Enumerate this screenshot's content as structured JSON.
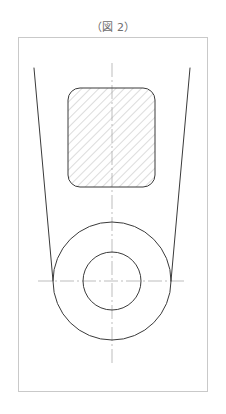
{
  "figure": {
    "title": "（図 2）",
    "caption_color": "#6e6e6e"
  },
  "canvas": {
    "width": 226,
    "height": 414,
    "background": "#ffffff"
  },
  "colors": {
    "frame_stroke": "#c9c9c9",
    "outline_stroke": "#3a3a3a",
    "hatch_stroke": "#9a9a9a",
    "centerline_stroke": "#b5b5b5"
  },
  "drawing": {
    "type": "engineering-drawing",
    "description": "Front view of a tapered guide with a rounded square hatched section and a concentric bore",
    "frame": {
      "x": 18,
      "y": 37,
      "width": 190,
      "height": 355,
      "stroke_width": 1
    },
    "taper_lines": [
      {
        "name": "left-taper-line",
        "x1": 34,
        "y1": 68,
        "x2": 53,
        "y2": 281
      },
      {
        "name": "right-taper-line",
        "x1": 190,
        "y1": 68,
        "x2": 171,
        "y2": 281
      }
    ],
    "hatched_section": {
      "name": "hatched-rounded-rect",
      "x": 68,
      "y": 88,
      "width": 87,
      "height": 99,
      "corner_radius": 12,
      "hatch_angle_deg": 45,
      "hatch_spacing": 6
    },
    "circles": [
      {
        "name": "outer-circle",
        "cx": 112,
        "cy": 281,
        "r": 59
      },
      {
        "name": "inner-circle",
        "cx": 112,
        "cy": 281,
        "r": 29
      }
    ],
    "center_lines": {
      "vertical": {
        "x": 112,
        "y1": 63,
        "y2": 365
      },
      "horizontal": {
        "y": 281,
        "x1": 38,
        "x2": 186
      },
      "dash_pattern": "14 3 2 3"
    }
  }
}
